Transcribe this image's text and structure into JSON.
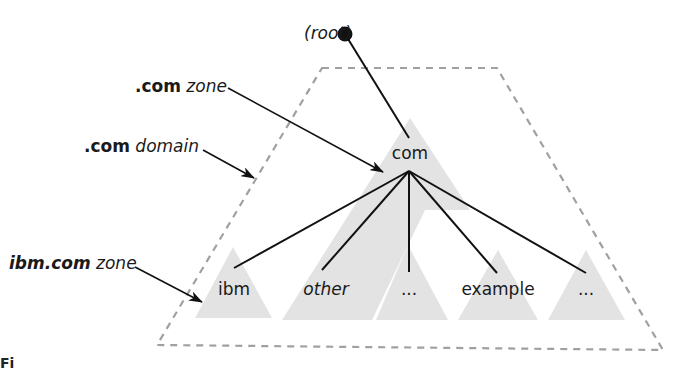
{
  "diagram": {
    "root": {
      "label": "(root)"
    },
    "callouts": {
      "com_zone": {
        "bold": ".com",
        "rest": " zone"
      },
      "com_domain": {
        "bold": ".com",
        "rest": " domain"
      },
      "ibm_zone": {
        "bold": "ibm.com",
        "rest": " zone"
      }
    },
    "nodes": {
      "com": "com",
      "ibm": "ibm",
      "other": "other",
      "ellipsis_mid": "...",
      "example": "example",
      "ellipsis_right": "..."
    },
    "caption_fragment": "Fi"
  },
  "colors": {
    "zone_fill": "#e3e3e3",
    "domain_outline": "#a0a0a0",
    "line": "#111111"
  }
}
